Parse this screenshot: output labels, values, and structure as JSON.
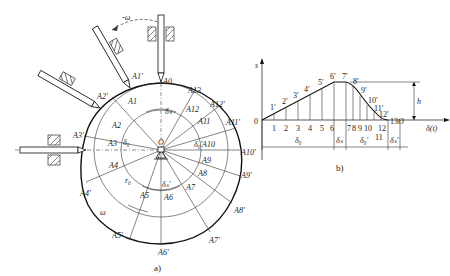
{
  "figure_a": {
    "caption": "a)",
    "center_label": "O",
    "rotation_label_top": "-ω",
    "rotation_label_bottom": "ω",
    "base_radius_label": "r₀",
    "angles": {
      "rise": "δ₀",
      "dwell_far": "δₛ",
      "return": "δ₀′",
      "dwell_near": "δₛ′"
    },
    "base_points": [
      "A0",
      "A1",
      "A2",
      "A3",
      "A4",
      "A5",
      "A6",
      "A7",
      "A8",
      "A9",
      "A10",
      "A11",
      "A12",
      "A13"
    ],
    "profile_points": [
      "A1′",
      "A2′",
      "A3′",
      "A4′",
      "A5′",
      "A6′",
      "A7′",
      "A8′",
      "A9′",
      "A10′",
      "A11′",
      "A12′"
    ]
  },
  "figure_b": {
    "caption": "b)",
    "y_axis_label": "s",
    "x_axis_label": "δ(t)",
    "origin_label": "0",
    "end_label": "O",
    "height_label": "h",
    "curve_points": [
      "1′",
      "2′",
      "3′",
      "4′",
      "5′",
      "6′",
      "7′",
      "8′",
      "9′",
      "10′",
      "11′",
      "12′",
      "13"
    ],
    "x_ticks": [
      "1",
      "2",
      "3",
      "4",
      "5",
      "6",
      "7",
      "8",
      "9",
      "10",
      "11",
      "12"
    ],
    "segments": [
      "δ₀",
      "δₛ",
      "δ₀′",
      "δₛ′"
    ]
  }
}
